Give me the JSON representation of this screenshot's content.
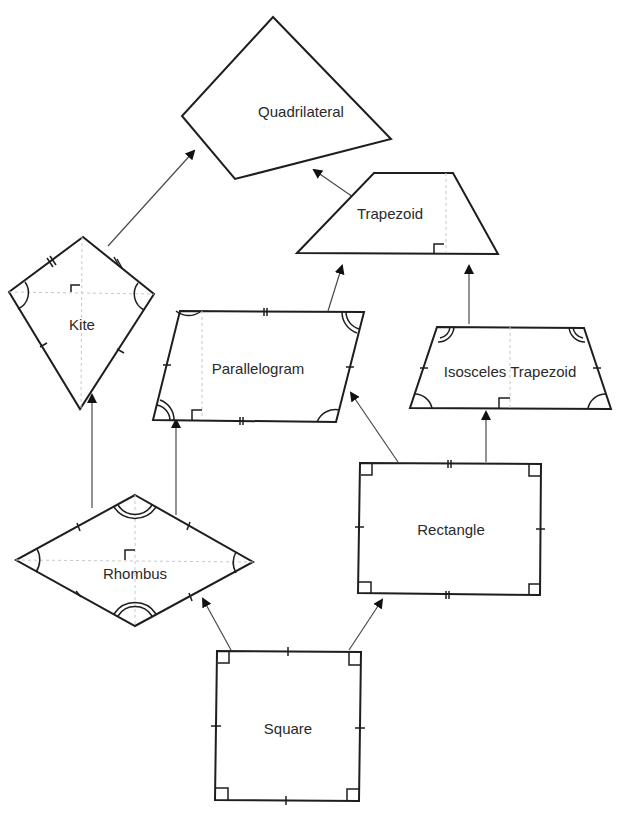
{
  "diagram": {
    "colors": {
      "stroke": "#1e1e1e",
      "arrow": "#4a4a4a",
      "guide": "#c8c8c8",
      "text": "#2a2a2a",
      "background": "#ffffff"
    },
    "nodes": [
      {
        "id": "quadrilateral",
        "label": "Quadrilateral",
        "label_pos": [
          301,
          111
        ]
      },
      {
        "id": "trapezoid",
        "label": "Trapezoid",
        "label_pos": [
          390,
          213
        ]
      },
      {
        "id": "kite",
        "label": "Kite",
        "label_pos": [
          82,
          324
        ]
      },
      {
        "id": "parallelogram",
        "label": "Parallelogram",
        "label_pos": [
          258,
          368
        ]
      },
      {
        "id": "isosceles_trapezoid",
        "label": "Isosceles Trapezoid",
        "label_pos": [
          510,
          371
        ]
      },
      {
        "id": "rhombus",
        "label": "Rhombus",
        "label_pos": [
          135,
          573
        ]
      },
      {
        "id": "rectangle",
        "label": "Rectangle",
        "label_pos": [
          451,
          529
        ]
      },
      {
        "id": "square",
        "label": "Square",
        "label_pos": [
          288,
          728
        ]
      }
    ],
    "edges": [
      {
        "from": "kite",
        "to": "quadrilateral"
      },
      {
        "from": "trapezoid",
        "to": "quadrilateral"
      },
      {
        "from": "parallelogram",
        "to": "trapezoid"
      },
      {
        "from": "isosceles_trapezoid",
        "to": "trapezoid"
      },
      {
        "from": "rhombus",
        "to": "kite"
      },
      {
        "from": "rhombus",
        "to": "parallelogram"
      },
      {
        "from": "rectangle",
        "to": "parallelogram"
      },
      {
        "from": "rectangle",
        "to": "isosceles_trapezoid"
      },
      {
        "from": "square",
        "to": "rhombus"
      },
      {
        "from": "square",
        "to": "rectangle"
      }
    ]
  }
}
